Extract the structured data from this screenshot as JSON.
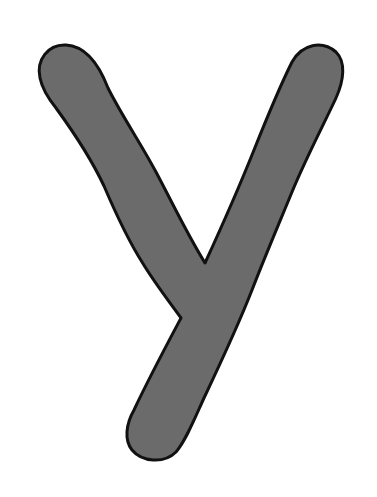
{
  "image": {
    "letter": "y",
    "background_color": "#ffffff",
    "fill_color": "#6b6b6b",
    "stroke_color": "#111111"
  }
}
